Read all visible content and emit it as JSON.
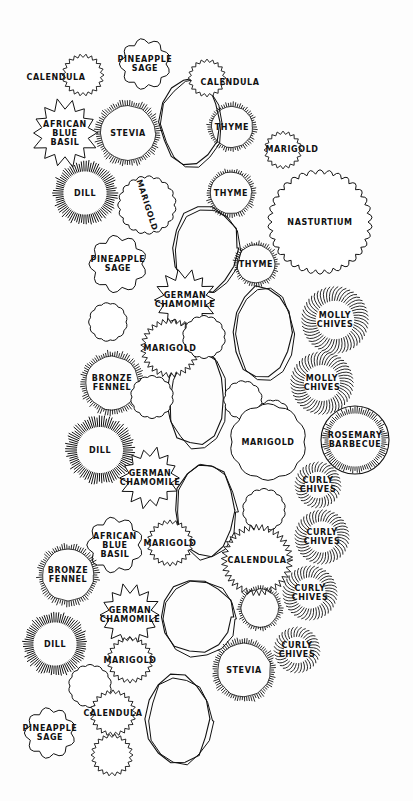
{
  "diagram": {
    "title": "",
    "type": "garden-planting-plan",
    "stroke_color": "#111111",
    "background_color": "#fdfdfd",
    "stepping_stones": [
      {
        "x": 190,
        "y": 122,
        "rx": 30,
        "ry": 44
      },
      {
        "x": 205,
        "y": 248,
        "rx": 33,
        "ry": 43
      },
      {
        "x": 262,
        "y": 332,
        "rx": 29,
        "ry": 46
      },
      {
        "x": 196,
        "y": 398,
        "rx": 29,
        "ry": 48
      },
      {
        "x": 205,
        "y": 510,
        "rx": 30,
        "ry": 48
      },
      {
        "x": 197,
        "y": 617,
        "rx": 36,
        "ry": 37
      },
      {
        "x": 178,
        "y": 719,
        "rx": 32,
        "ry": 44
      }
    ],
    "plants": [
      {
        "id": "calendula-1",
        "label": "CALENDULA",
        "x": 56,
        "y": 77,
        "lx": 56,
        "ly": 77,
        "r": 0,
        "style": "none"
      },
      {
        "id": "calendula-1-shape",
        "label": "",
        "x": 83,
        "y": 75,
        "r": 20,
        "style": "fringe"
      },
      {
        "id": "pineapple-sage-1",
        "label": "PINEAPPLE\nSAGE",
        "x": 145,
        "y": 64,
        "r": 30,
        "style": "leaf"
      },
      {
        "id": "calendula-2",
        "label": "CALENDULA",
        "x": 207,
        "y": 78,
        "lx": 230,
        "ly": 82,
        "r": 18,
        "style": "fringe"
      },
      {
        "id": "african-blue-basil-1",
        "label": "AFRICAN\nBLUE\nBASIL",
        "x": 65,
        "y": 133,
        "r": 33,
        "style": "star"
      },
      {
        "id": "stevia-1",
        "label": "STEVIA",
        "x": 128,
        "y": 133,
        "r": 32,
        "style": "hatch"
      },
      {
        "id": "thyme-1",
        "label": "THYME",
        "x": 232,
        "y": 127,
        "r": 24,
        "style": "hatch"
      },
      {
        "id": "marigold-1",
        "label": "MARIGOLD",
        "x": 283,
        "y": 150,
        "lx": 292,
        "ly": 149,
        "r": 18,
        "style": "fringe"
      },
      {
        "id": "dill-1",
        "label": "DILL",
        "x": 85,
        "y": 193,
        "r": 30,
        "style": "radial"
      },
      {
        "id": "marigold-2",
        "label": "MARIGOLD",
        "x": 147,
        "y": 205,
        "r": 27,
        "style": "scallop",
        "vertical": true
      },
      {
        "id": "thyme-2",
        "label": "THYME",
        "x": 231,
        "y": 193,
        "r": 24,
        "style": "hatch"
      },
      {
        "id": "nasturtium-1",
        "label": "NASTURTIUM",
        "x": 320,
        "y": 222,
        "r": 48,
        "style": "scallop"
      },
      {
        "id": "pineapple-sage-2",
        "label": "PINEAPPLE\nSAGE",
        "x": 118,
        "y": 264,
        "r": 34,
        "style": "leaf"
      },
      {
        "id": "thyme-3",
        "label": "THYME",
        "x": 256,
        "y": 264,
        "r": 22,
        "style": "hatch"
      },
      {
        "id": "german-chamomile-1",
        "label": "GERMAN\nCHAMOMILE",
        "x": 185,
        "y": 300,
        "r": 30,
        "style": "star"
      },
      {
        "id": "plant-unlabeled-1",
        "label": "",
        "x": 108,
        "y": 322,
        "r": 18,
        "style": "scallop"
      },
      {
        "id": "molly-chives-1",
        "label": "MOLLY\nCHIVES",
        "x": 335,
        "y": 320,
        "r": 32,
        "style": "grass"
      },
      {
        "id": "marigold-3",
        "label": "MARIGOLD",
        "x": 170,
        "y": 348,
        "r": 28,
        "style": "fringe"
      },
      {
        "id": "plant-unlabeled-2",
        "label": "",
        "x": 204,
        "y": 337,
        "r": 20,
        "style": "scallop"
      },
      {
        "id": "molly-chives-2",
        "label": "MOLLY\nCHIVES",
        "x": 322,
        "y": 383,
        "r": 30,
        "style": "grass"
      },
      {
        "id": "bronze-fennel-1",
        "label": "BRONZE\nFENNEL",
        "x": 112,
        "y": 383,
        "r": 31,
        "style": "hatch"
      },
      {
        "id": "plant-unlabeled-3",
        "label": "",
        "x": 152,
        "y": 397,
        "r": 20,
        "style": "scallop"
      },
      {
        "id": "plant-unlabeled-4",
        "label": "",
        "x": 243,
        "y": 400,
        "r": 18,
        "style": "scallop"
      },
      {
        "id": "plant-unlabeled-5",
        "label": "",
        "x": 273,
        "y": 418,
        "r": 17,
        "style": "scallop"
      },
      {
        "id": "rosemary-barbecue-1",
        "label": "ROSEMARY\nBARBECUE",
        "x": 355,
        "y": 440,
        "r": 34,
        "style": "circle-hatch"
      },
      {
        "id": "dill-2",
        "label": "DILL",
        "x": 100,
        "y": 450,
        "r": 32,
        "style": "radial"
      },
      {
        "id": "marigold-4",
        "label": "MARIGOLD",
        "x": 268,
        "y": 442,
        "r": 36,
        "style": "cluster"
      },
      {
        "id": "german-chamomile-2",
        "label": "GERMAN\nCHAMOMILE",
        "x": 150,
        "y": 478,
        "r": 30,
        "style": "star"
      },
      {
        "id": "curly-chives-1",
        "label": "CURLY\nCHIVES",
        "x": 318,
        "y": 485,
        "r": 22,
        "style": "grass"
      },
      {
        "id": "plant-unlabeled-6",
        "label": "",
        "x": 264,
        "y": 510,
        "r": 20,
        "style": "scallop"
      },
      {
        "id": "african-blue-basil-2",
        "label": "AFRICAN\nBLUE\nBASIL",
        "x": 115,
        "y": 545,
        "r": 33,
        "style": "leaf"
      },
      {
        "id": "marigold-5",
        "label": "MARIGOLD",
        "x": 170,
        "y": 543,
        "r": 22,
        "style": "fringe"
      },
      {
        "id": "curly-chives-2",
        "label": "CURLY\nCHIVES",
        "x": 322,
        "y": 537,
        "r": 26,
        "style": "grass"
      },
      {
        "id": "calendula-3",
        "label": "CALENDULA",
        "x": 257,
        "y": 560,
        "r": 34,
        "style": "fringe"
      },
      {
        "id": "bronze-fennel-2",
        "label": "BRONZE\nFENNEL",
        "x": 68,
        "y": 575,
        "r": 30,
        "style": "hatch"
      },
      {
        "id": "curly-chives-3",
        "label": "CURLY\nCHIVES",
        "x": 310,
        "y": 593,
        "r": 26,
        "style": "grass"
      },
      {
        "id": "plant-unlabeled-7",
        "label": "",
        "x": 260,
        "y": 608,
        "r": 22,
        "style": "hatch"
      },
      {
        "id": "german-chamomile-3",
        "label": "GERMAN\nCHAMOMILE",
        "x": 130,
        "y": 615,
        "r": 30,
        "style": "star"
      },
      {
        "id": "curly-chives-4",
        "label": "CURLY\nCHIVES",
        "x": 297,
        "y": 650,
        "r": 22,
        "style": "grass"
      },
      {
        "id": "dill-3",
        "label": "DILL",
        "x": 55,
        "y": 644,
        "r": 30,
        "style": "radial"
      },
      {
        "id": "marigold-6",
        "label": "MARIGOLD",
        "x": 130,
        "y": 660,
        "r": 22,
        "style": "fringe"
      },
      {
        "id": "stevia-2",
        "label": "STEVIA",
        "x": 244,
        "y": 670,
        "r": 31,
        "style": "hatch"
      },
      {
        "id": "plant-unlabeled-8",
        "label": "",
        "x": 90,
        "y": 686,
        "r": 20,
        "style": "scallop"
      },
      {
        "id": "calendula-4",
        "label": "CALENDULA",
        "x": 113,
        "y": 713,
        "r": 22,
        "style": "fringe"
      },
      {
        "id": "pineapple-sage-3",
        "label": "PINEAPPLE\nSAGE",
        "x": 50,
        "y": 733,
        "r": 30,
        "style": "leaf"
      },
      {
        "id": "plant-unlabeled-9",
        "label": "",
        "x": 112,
        "y": 755,
        "r": 20,
        "style": "fringe"
      }
    ]
  }
}
